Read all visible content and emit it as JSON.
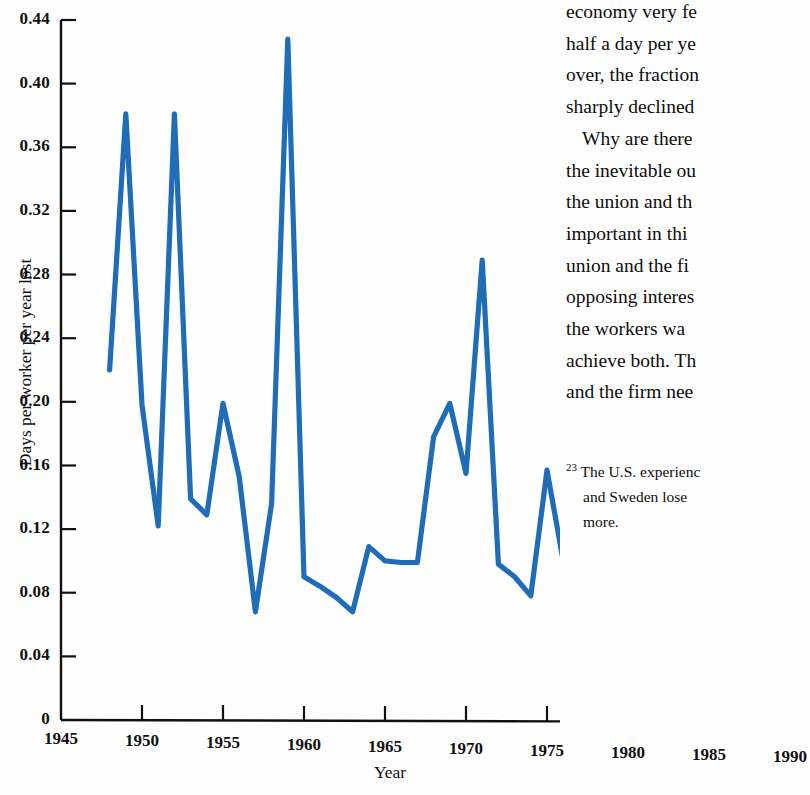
{
  "chart_data": {
    "type": "line",
    "title": "",
    "xlabel": "Year",
    "ylabel": "Days per worker per year lost",
    "xlim": [
      1945,
      1990
    ],
    "ylim": [
      0,
      0.44
    ],
    "grid": false,
    "legend": "none",
    "line_color": "#1f6cb8",
    "x_ticks": [
      "1945",
      "1950",
      "1955",
      "1960",
      "1965",
      "1970",
      "1975",
      "1980",
      "1985",
      "1990"
    ],
    "y_ticks": [
      "0",
      "0.04",
      "0.08",
      "0.12",
      "0.16",
      "0.20",
      "0.24",
      "0.28",
      "0.32",
      "0.36",
      "0.40",
      "0.44"
    ],
    "series": [
      {
        "name": "Days per worker per year lost",
        "x": [
          1948,
          1949,
          1950,
          1951,
          1952,
          1953,
          1954,
          1955,
          1956,
          1957,
          1958,
          1959,
          1960,
          1961,
          1962,
          1963,
          1964,
          1965,
          1966,
          1967,
          1968,
          1969,
          1970,
          1971,
          1972,
          1973,
          1974,
          1975,
          1976,
          1977,
          1978,
          1979,
          1980,
          1981,
          1982,
          1983,
          1984
        ],
        "values": [
          0.22,
          0.381,
          0.198,
          0.122,
          0.381,
          0.139,
          0.129,
          0.199,
          0.153,
          0.068,
          0.136,
          0.428,
          0.09,
          0.084,
          0.077,
          0.068,
          0.109,
          0.1,
          0.099,
          0.099,
          0.178,
          0.199,
          0.155,
          0.289,
          0.098,
          0.09,
          0.078,
          0.157,
          0.1,
          0.122,
          0.106,
          0.108,
          0.094,
          0.094,
          0.039,
          0.076,
          0.038
        ]
      }
    ]
  },
  "axes": {
    "y_title": "Days per worker per year lost",
    "x_title": "Year",
    "y_ticks": [
      "0.44",
      "0.40",
      "0.36",
      "0.32",
      "0.28",
      "0.24",
      "0.20",
      "0.16",
      "0.12",
      "0.08",
      "0.04",
      "0"
    ],
    "x_ticks": [
      "1945",
      "1950",
      "1955",
      "1960",
      "1965",
      "1970",
      "1975",
      "1980",
      "1985",
      "1990"
    ]
  },
  "text_column": {
    "lines": [
      "economy very fe",
      "half a day per ye",
      "over, the fraction",
      "sharply declined",
      "Why are there",
      "the inevitable ou",
      "the union and th",
      "important in thi",
      "union and the fi",
      "opposing interes",
      "the workers wa",
      "achieve both. Th",
      "and the firm nee"
    ]
  },
  "footnote": {
    "marker": "23",
    "lines": [
      "The U.S. experienc",
      "and Sweden lose",
      "more."
    ]
  }
}
